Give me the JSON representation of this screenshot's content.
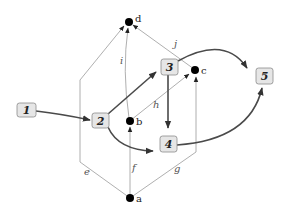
{
  "diagram": {
    "nodes": [
      {
        "id": "a",
        "label": "a"
      },
      {
        "id": "b",
        "label": "b"
      },
      {
        "id": "c",
        "label": "c"
      },
      {
        "id": "d",
        "label": "d"
      }
    ],
    "edges": [
      {
        "id": "e",
        "label": "e",
        "from": "a",
        "to": "d"
      },
      {
        "id": "f",
        "label": "f",
        "from": "a",
        "to": "b"
      },
      {
        "id": "g",
        "label": "g",
        "from": "a",
        "to": "c"
      },
      {
        "id": "h",
        "label": "h",
        "from": "b",
        "to": "c"
      },
      {
        "id": "i",
        "label": "i",
        "from": "b",
        "to": "d"
      },
      {
        "id": "j",
        "label": "j",
        "from": "c",
        "to": "d"
      }
    ],
    "boxes": [
      {
        "id": "1",
        "label": "1"
      },
      {
        "id": "2",
        "label": "2"
      },
      {
        "id": "3",
        "label": "3"
      },
      {
        "id": "4",
        "label": "4"
      },
      {
        "id": "5",
        "label": "5"
      }
    ],
    "flow_arrows": [
      {
        "from": "1",
        "to": "2"
      },
      {
        "from": "2",
        "to": "3"
      },
      {
        "from": "2",
        "to": "4"
      },
      {
        "from": "3",
        "to": "4"
      },
      {
        "from": "3",
        "to": "5"
      },
      {
        "from": "4",
        "to": "5"
      }
    ],
    "colors": {
      "thin_edge": "#9a9a9a",
      "thick_edge": "#4a4a4a",
      "box_fill": "#e6e6e6",
      "box_stroke": "#8a8a8a"
    }
  }
}
